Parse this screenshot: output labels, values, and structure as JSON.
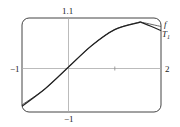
{
  "chart_data": {
    "type": "line",
    "title": "",
    "xlabel": "",
    "ylabel": "",
    "xlim": [
      -1,
      2
    ],
    "ylim": [
      -1,
      1.1
    ],
    "grid": false,
    "x_tick_labels": [
      "-1",
      "2"
    ],
    "y_tick_labels": [
      "1.1",
      "-1"
    ],
    "x_ticks": [
      1
    ],
    "series": [
      {
        "name": "f",
        "x": [
          -1,
          -0.5,
          0,
          0.5,
          1,
          1.5,
          1.6,
          2
        ],
        "y": [
          -0.84,
          -0.48,
          0,
          0.48,
          0.84,
          1.0,
          1.0,
          0.91
        ]
      },
      {
        "name": "T1",
        "x": [
          -1,
          -0.5,
          0,
          0.5,
          1,
          1.5,
          1.6,
          2
        ],
        "y": [
          -0.87,
          -0.48,
          0,
          0.48,
          0.84,
          0.99,
          0.99,
          0.82
        ]
      }
    ],
    "legend": [
      "f",
      "T1"
    ],
    "legend_position": "right-of-curves"
  },
  "labels": {
    "x_min": "−1",
    "x_max": "2",
    "y_max": "1.1",
    "y_min": "−1",
    "f": "f",
    "t": "T",
    "t_sub": "1"
  }
}
